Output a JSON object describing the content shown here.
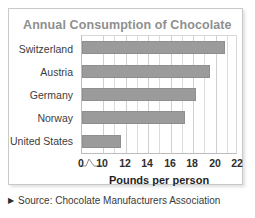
{
  "chart_data": {
    "type": "bar",
    "orientation": "horizontal",
    "title": "Annual Consumption of Chocolate",
    "xlabel": "Pounds per person",
    "ylabel": "",
    "categories": [
      "Switzerland",
      "Austria",
      "Germany",
      "Norway",
      "United States"
    ],
    "values": [
      20.8,
      19.5,
      18.3,
      17.3,
      11.6
    ],
    "xticks": [
      0,
      10,
      12,
      14,
      16,
      18,
      20,
      22
    ],
    "xtick_labels": [
      "0",
      "10",
      "12",
      "14",
      "16",
      "18",
      "20",
      "22"
    ],
    "xlim": [
      0,
      22
    ],
    "axis_break": true,
    "axis_break_between": [
      0,
      10
    ],
    "grid": true,
    "grid_axis": "x",
    "legend": false,
    "bar_color": "#9b9b9b",
    "title_color": "#8f8f8f",
    "grid_color": "#dcdcdc"
  },
  "source": {
    "marker": "triangle-right-icon",
    "text": "Source: Chocolate Manufacturers Association"
  }
}
